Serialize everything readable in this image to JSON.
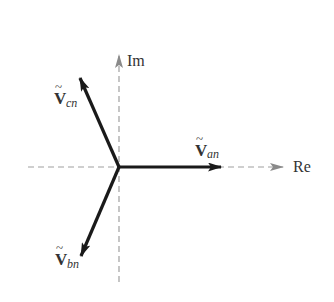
{
  "diagram": {
    "type": "phasor-diagram",
    "axes": {
      "real": {
        "label": "Re"
      },
      "imag": {
        "label": "Im"
      }
    },
    "phasors": [
      {
        "id": "van",
        "symbol": "V",
        "subscript": "an",
        "angle_deg": 0
      },
      {
        "id": "vbn",
        "symbol": "V",
        "subscript": "bn",
        "angle_deg": -120
      },
      {
        "id": "vcn",
        "symbol": "V",
        "subscript": "cn",
        "angle_deg": 120
      }
    ],
    "tilde": "~",
    "colors": {
      "phasor": "#1a1a1a",
      "axis": "#999999",
      "label": "#333333"
    }
  }
}
